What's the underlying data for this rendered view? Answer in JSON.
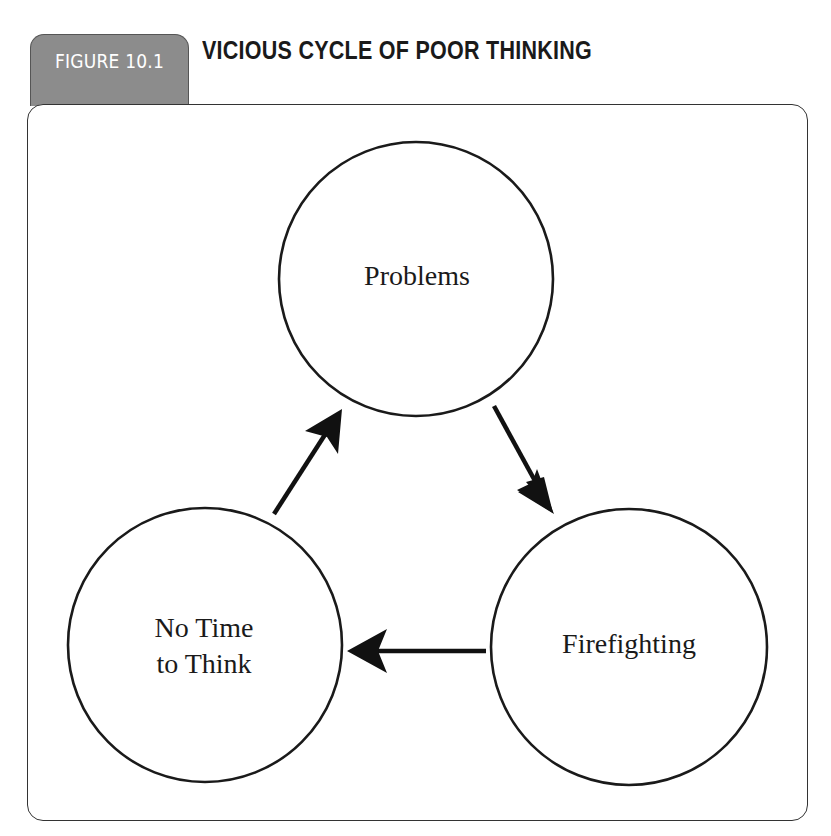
{
  "figure": {
    "tab_label": "FIGURE 10.1",
    "title": "VICIOUS CYCLE OF POOR THINKING",
    "tab_color": "#8c8c8c"
  },
  "diagram": {
    "nodes": [
      {
        "id": "problems",
        "label": "Problems",
        "cx": 416,
        "cy": 279,
        "r": 137
      },
      {
        "id": "firefighting",
        "label": "Firefighting",
        "cx": 629,
        "cy": 647,
        "r": 138
      },
      {
        "id": "no-time",
        "label_line1": "No Time",
        "label_line2": "to Think",
        "cx": 205,
        "cy": 645,
        "r": 137
      }
    ],
    "edges": [
      {
        "from": "problems",
        "to": "firefighting"
      },
      {
        "from": "firefighting",
        "to": "no-time"
      },
      {
        "from": "no-time",
        "to": "problems"
      }
    ]
  }
}
